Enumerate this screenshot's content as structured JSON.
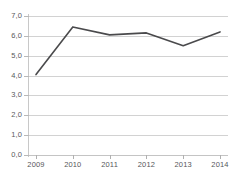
{
  "chart_data": {
    "type": "line",
    "title": "",
    "subtitle": "",
    "xlabel": "",
    "ylabel": "",
    "categories": [
      "2009",
      "2010",
      "2011",
      "2012",
      "2013",
      "2014"
    ],
    "values": [
      4.05,
      6.45,
      6.05,
      6.15,
      5.5,
      6.2
    ],
    "series": [
      {
        "name": "",
        "values": [
          4.05,
          6.45,
          6.05,
          6.15,
          5.5,
          6.2
        ]
      }
    ],
    "ylim": [
      0.0,
      7.0
    ],
    "ytick_step": 1.0,
    "ytick_labels": [
      "0,0",
      "1,0",
      "2,0",
      "3,0",
      "4,0",
      "5,0",
      "6,0",
      "7,0"
    ],
    "ytick_values": [
      0.0,
      1.0,
      2.0,
      3.0,
      4.0,
      5.0,
      6.0,
      7.0
    ],
    "xtick_labels": [
      "2009",
      "2010",
      "2011",
      "2012",
      "2013",
      "2014"
    ],
    "grid": "horizontal",
    "legend": "none",
    "annotations": [],
    "decimal_separator": ",",
    "colors": {
      "line": "#3b3b3d",
      "gridline": "#d2d2d2",
      "axis": "#c8c8c8",
      "tick_label": "#56565a",
      "background": "#ffffff"
    }
  }
}
